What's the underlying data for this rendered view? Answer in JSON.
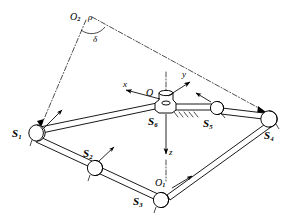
{
  "figure": {
    "type": "mechanism-diagram",
    "background_color": "#ffffff",
    "line_color": "#000000",
    "width": 288,
    "height": 223
  },
  "labels": {
    "joint_s1": "S",
    "joint_s1_sub": "1",
    "joint_s2": "S",
    "joint_s2_sub": "2",
    "joint_s3": "S",
    "joint_s3_sub": "3",
    "joint_s4": "S",
    "joint_s4_sub": "4",
    "joint_s5": "S",
    "joint_s5_sub": "5",
    "joint_s6": "S",
    "joint_s6_sub": "6",
    "origin_o1": "O",
    "origin_o1_sub": "1",
    "origin_o2": "O",
    "origin_o2_sub": "2",
    "axis_x": "x",
    "axis_y": "y",
    "axis_z": "z",
    "radius_rho": "ρ",
    "angle_delta": "δ"
  },
  "geometry": {
    "joints": [
      {
        "name": "S1",
        "x": 35,
        "y": 131
      },
      {
        "name": "S2",
        "x": 95,
        "y": 166
      },
      {
        "name": "S3",
        "x": 160,
        "y": 199
      },
      {
        "name": "S4",
        "x": 269,
        "y": 117
      },
      {
        "name": "S5",
        "x": 216,
        "y": 110
      },
      {
        "name": "S6",
        "x": 160,
        "y": 107
      }
    ],
    "origins": [
      {
        "name": "O1",
        "x": 166,
        "y": 183
      },
      {
        "name": "O2",
        "x": 86,
        "y": 18
      }
    ],
    "axes": {
      "x_tip": {
        "x": 125,
        "y": 89
      },
      "y_tip": {
        "x": 189,
        "y": 81
      },
      "z_tip": {
        "x": 166,
        "y": 155
      }
    },
    "angle_delta_vertex": {
      "x": 86,
      "y": 18
    }
  }
}
